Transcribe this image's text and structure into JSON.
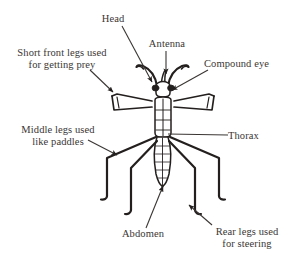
{
  "figure": {
    "kind": "labeled-anatomical-diagram",
    "background_color": "#ffffff",
    "ink_color": "#231f1e",
    "text_color": "#3a3634"
  },
  "labels": {
    "head": "Head",
    "antenna": "Antenna",
    "compound_eye": "Compound eye",
    "front_legs": "Short front legs used\nfor getting prey",
    "middle_legs": "Middle legs used\nlike paddles",
    "thorax": "Thorax",
    "abdomen": "Abdomen",
    "rear_legs": "Rear legs used\nfor steering"
  },
  "parts": [
    {
      "id": "head",
      "label": "Head"
    },
    {
      "id": "antenna",
      "label": "Antenna"
    },
    {
      "id": "compound-eye",
      "label": "Compound eye"
    },
    {
      "id": "front-legs",
      "label": "Short front legs used for getting prey"
    },
    {
      "id": "middle-legs",
      "label": "Middle legs used like paddles"
    },
    {
      "id": "thorax",
      "label": "Thorax"
    },
    {
      "id": "abdomen",
      "label": "Abdomen"
    },
    {
      "id": "rear-legs",
      "label": "Rear legs used for steering"
    }
  ]
}
